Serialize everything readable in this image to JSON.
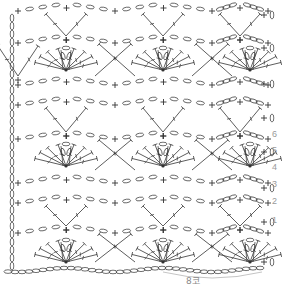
{
  "diagram": {
    "type": "crochet-stitch-chart",
    "stroke_color": "#333333",
    "label_color": "#9a9a9a",
    "repeat_label": "8코",
    "row_numbers": [
      {
        "label": "6",
        "y": 135
      },
      {
        "label": "5",
        "y": 151
      },
      {
        "label": "4",
        "y": 168
      },
      {
        "label": "3",
        "y": 185
      },
      {
        "label": "2",
        "y": 202
      },
      {
        "label": "1",
        "y": 221
      }
    ],
    "turning_chain_rows_y": [
      15,
      48,
      84,
      118,
      152,
      188,
      222,
      262
    ],
    "repeat_width": 97,
    "repeat_count": 3,
    "fan_rows_y": [
      70,
      166,
      262
    ],
    "v_rows_y": [
      8,
      104,
      200
    ],
    "mesh_rows_y": [
      38,
      134,
      230
    ]
  }
}
